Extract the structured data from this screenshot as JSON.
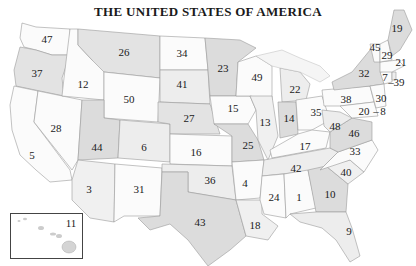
{
  "title": "THE UNITED STATES OF AMERICA",
  "colors": {
    "light": "#fbfbfb",
    "medium": "#ececec",
    "dark": "#d9d9d9",
    "border": "#9a9a9a",
    "text": "#1a1a1a"
  },
  "states": [
    {
      "name": "Washington",
      "rank": "47",
      "x": 47,
      "y": 39
    },
    {
      "name": "Oregon",
      "rank": "37",
      "x": 37,
      "y": 73
    },
    {
      "name": "Idaho",
      "rank": "12",
      "x": 83,
      "y": 84
    },
    {
      "name": "Montana",
      "rank": "26",
      "x": 124,
      "y": 52
    },
    {
      "name": "Wyoming",
      "rank": "50",
      "x": 129,
      "y": 99
    },
    {
      "name": "California",
      "rank": "28",
      "x": 56,
      "y": 128
    },
    {
      "name": "California south",
      "rank": "5",
      "x": 32,
      "y": 155
    },
    {
      "name": "Nevada",
      "rank": "44",
      "x": 97,
      "y": 147
    },
    {
      "name": "Utah",
      "rank": "6",
      "x": 144,
      "y": 147
    },
    {
      "name": "Arizona",
      "rank": "3",
      "x": 89,
      "y": 189
    },
    {
      "name": "New Mexico",
      "rank": "31",
      "x": 139,
      "y": 189
    },
    {
      "name": "North Dakota",
      "rank": "34",
      "x": 182,
      "y": 53
    },
    {
      "name": "South Dakota",
      "rank": "41",
      "x": 182,
      "y": 84
    },
    {
      "name": "Nebraska",
      "rank": "27",
      "x": 189,
      "y": 118
    },
    {
      "name": "Kansas",
      "rank": "16",
      "x": 196,
      "y": 152
    },
    {
      "name": "Oklahoma",
      "rank": "36",
      "x": 210,
      "y": 180
    },
    {
      "name": "Texas",
      "rank": "43",
      "x": 200,
      "y": 222
    },
    {
      "name": "Minnesota",
      "rank": "23",
      "x": 223,
      "y": 68
    },
    {
      "name": "Iowa",
      "rank": "15",
      "x": 233,
      "y": 108
    },
    {
      "name": "Missouri",
      "rank": "25",
      "x": 248,
      "y": 145
    },
    {
      "name": "Arkansas",
      "rank": "4",
      "x": 245,
      "y": 183
    },
    {
      "name": "Louisiana",
      "rank": "18",
      "x": 255,
      "y": 225
    },
    {
      "name": "Wisconsin",
      "rank": "49",
      "x": 257,
      "y": 77
    },
    {
      "name": "Illinois",
      "rank": "13",
      "x": 265,
      "y": 122
    },
    {
      "name": "Michigan",
      "rank": "22",
      "x": 295,
      "y": 89
    },
    {
      "name": "Indiana",
      "rank": "14",
      "x": 289,
      "y": 118
    },
    {
      "name": "Ohio",
      "rank": "35",
      "x": 316,
      "y": 112
    },
    {
      "name": "Kentucky",
      "rank": "17",
      "x": 305,
      "y": 146
    },
    {
      "name": "Tennessee",
      "rank": "42",
      "x": 296,
      "y": 168
    },
    {
      "name": "Mississippi",
      "rank": "24",
      "x": 274,
      "y": 197
    },
    {
      "name": "Alabama",
      "rank": "1",
      "x": 299,
      "y": 197
    },
    {
      "name": "Georgia",
      "rank": "10",
      "x": 330,
      "y": 194
    },
    {
      "name": "Florida",
      "rank": "9",
      "x": 349,
      "y": 231
    },
    {
      "name": "South Carolina",
      "rank": "40",
      "x": 346,
      "y": 172
    },
    {
      "name": "North Carolina",
      "rank": "33",
      "x": 355,
      "y": 151
    },
    {
      "name": "Virginia",
      "rank": "46",
      "x": 354,
      "y": 133
    },
    {
      "name": "West Virginia",
      "rank": "48",
      "x": 335,
      "y": 126
    },
    {
      "name": "Pennsylvania",
      "rank": "38",
      "x": 346,
      "y": 99
    },
    {
      "name": "New York",
      "rank": "32",
      "x": 364,
      "y": 73
    },
    {
      "name": "Maryland",
      "rank": "20",
      "x": 364,
      "y": 111
    },
    {
      "name": "Delaware",
      "rank": "8",
      "x": 383,
      "y": 111
    },
    {
      "name": "New Jersey",
      "rank": "30",
      "x": 381,
      "y": 98
    },
    {
      "name": "Connecticut",
      "rank": "7",
      "x": 385,
      "y": 77
    },
    {
      "name": "Rhode Island",
      "rank": "39",
      "x": 399,
      "y": 82
    },
    {
      "name": "Massachusetts",
      "rank": "21",
      "x": 401,
      "y": 62
    },
    {
      "name": "Vermont",
      "rank": "45",
      "x": 375,
      "y": 47
    },
    {
      "name": "New Hampshire",
      "rank": "29",
      "x": 387,
      "y": 55
    },
    {
      "name": "Maine",
      "rank": "19",
      "x": 397,
      "y": 28
    },
    {
      "name": "Hawaii",
      "rank": "11",
      "x": 71,
      "y": 223
    }
  ],
  "labels_aux": {
    "ri_dash": "–",
    "de_dash": "–"
  }
}
